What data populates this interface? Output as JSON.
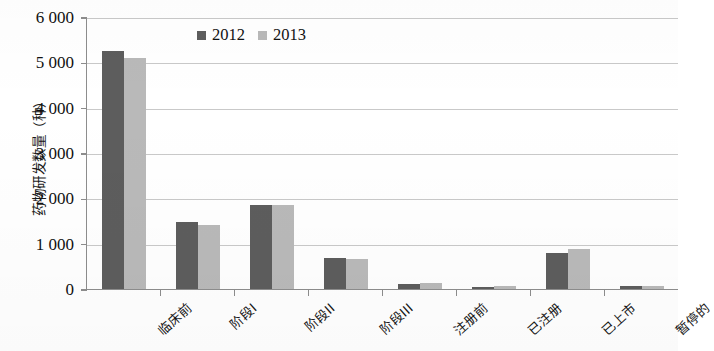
{
  "chart_data": {
    "type": "bar",
    "title": "",
    "xlabel": "",
    "ylabel": "药物研发数量（种）",
    "ylim": [
      0,
      6000
    ],
    "ytick_step": 1000,
    "grid": "horizontal",
    "legend_position": "top-center",
    "categories": [
      "临床前",
      "阶段I",
      "阶段II",
      "阶段III",
      "注册前",
      "已注册",
      "已上市",
      "暂停的"
    ],
    "ytick_labels": [
      "0",
      "1 000",
      "2 000",
      "3 000",
      "4 000",
      "5 000",
      "6 000"
    ],
    "ytick_values": [
      0,
      1000,
      2000,
      3000,
      4000,
      5000,
      6000
    ],
    "series": [
      {
        "name": "2012",
        "color": "#5d5d5d",
        "values": [
          5250,
          1480,
          1860,
          690,
          120,
          50,
          790,
          60
        ]
      },
      {
        "name": "2013",
        "color": "#b9b9b9",
        "values": [
          5100,
          1420,
          1860,
          670,
          140,
          60,
          880,
          70
        ]
      }
    ]
  },
  "legend": {
    "items": [
      {
        "label": "2012",
        "swatch": "legend-swatch-2012"
      },
      {
        "label": "2013",
        "swatch": "legend-swatch-2013"
      }
    ]
  },
  "colors": {
    "series_2012": "#5d5d5d",
    "series_2013": "#b9b9b9",
    "gridline": "#c9c9c9",
    "axis": "#8d8d8d",
    "background": "#ffffff"
  }
}
